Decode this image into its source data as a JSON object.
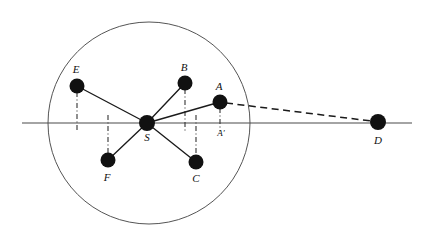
{
  "figure": {
    "type": "geometry-diagram",
    "title": "",
    "background_color": "#ffffff",
    "stroke_color": "#1a1a1a",
    "node_fill_color": "#111111",
    "circle_stroke_color": "#555555",
    "dashdot_color": "#333333",
    "canvas": {
      "width": 422,
      "height": 235
    }
  },
  "axis": {
    "name": "horizontal-axis",
    "x1": 22,
    "y1": 123,
    "x2": 412,
    "y2": 123
  },
  "circle": {
    "name": "main-circle",
    "cx": 149,
    "cy": 123,
    "r": 101
  },
  "points": [
    {
      "id": "S",
      "label": "S",
      "cx": 147,
      "cy": 123,
      "r": 8,
      "label_x": 147,
      "label_y": 138
    },
    {
      "id": "E",
      "label": "E",
      "cx": 77,
      "cy": 86,
      "r": 7.5,
      "label_x": 76,
      "label_y": 70
    },
    {
      "id": "B",
      "label": "B",
      "cx": 185,
      "cy": 83,
      "r": 7.5,
      "label_x": 184,
      "label_y": 68
    },
    {
      "id": "A",
      "label": "A",
      "cx": 220,
      "cy": 102,
      "r": 7.5,
      "label_x": 219,
      "label_y": 87
    },
    {
      "id": "F",
      "label": "F",
      "cx": 108,
      "cy": 160,
      "r": 7.5,
      "label_x": 107,
      "label_y": 178
    },
    {
      "id": "C",
      "label": "C",
      "cx": 196,
      "cy": 162,
      "r": 7.5,
      "label_x": 196,
      "label_y": 179
    },
    {
      "id": "D",
      "label": "D",
      "cx": 378,
      "cy": 122,
      "r": 8,
      "label_x": 378,
      "label_y": 141
    }
  ],
  "foot_labels": [
    {
      "id": "Aprime",
      "label": "A′",
      "label_x": 221,
      "label_y": 134
    }
  ],
  "radii": [
    {
      "name": "segment-S-E",
      "from": "S",
      "to": "E",
      "x1": 147,
      "y1": 123,
      "x2": 77,
      "y2": 86
    },
    {
      "name": "segment-S-B",
      "from": "S",
      "to": "B",
      "x1": 147,
      "y1": 123,
      "x2": 185,
      "y2": 83
    },
    {
      "name": "segment-S-A",
      "from": "S",
      "to": "A",
      "x1": 147,
      "y1": 123,
      "x2": 220,
      "y2": 102
    },
    {
      "name": "segment-S-F",
      "from": "S",
      "to": "F",
      "x1": 147,
      "y1": 123,
      "x2": 108,
      "y2": 160
    },
    {
      "name": "segment-S-C",
      "from": "S",
      "to": "C",
      "x1": 147,
      "y1": 123,
      "x2": 196,
      "y2": 162
    }
  ],
  "dashed_line": {
    "name": "segment-A-D",
    "from": "A",
    "to": "D",
    "x1": 226,
    "y1": 103,
    "x2": 371,
    "y2": 121
  },
  "projection_lines": [
    {
      "name": "projection-E",
      "point": "E",
      "x": 77,
      "y1": 92,
      "y2": 131
    },
    {
      "name": "projection-B",
      "point": "B",
      "x": 185,
      "y1": 89,
      "y2": 131
    },
    {
      "name": "projection-A",
      "point": "A",
      "x": 220,
      "y1": 108,
      "y2": 131
    },
    {
      "name": "projection-F",
      "point": "F",
      "x": 108,
      "y1": 115,
      "y2": 154
    },
    {
      "name": "projection-C",
      "point": "C",
      "x": 196,
      "y1": 115,
      "y2": 156
    }
  ]
}
